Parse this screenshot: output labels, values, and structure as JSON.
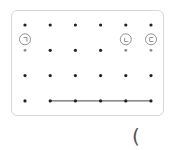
{
  "diagram": {
    "type": "dot-grid",
    "rows": 4,
    "cols": 6,
    "labels": [
      {
        "text": "ㄱ",
        "row": 1,
        "col": 0
      },
      {
        "text": "ㄴ",
        "row": 1,
        "col": 4
      },
      {
        "text": "ㄷ",
        "row": 1,
        "col": 5
      }
    ],
    "segments": [
      {
        "from": {
          "row": 3,
          "col": 1
        },
        "to": {
          "row": 3,
          "col": 5
        }
      }
    ],
    "faded_dots": [
      {
        "row": 1,
        "col": 0
      },
      {
        "row": 1,
        "col": 4
      },
      {
        "row": 1,
        "col": 5
      }
    ]
  },
  "answer_paren": "("
}
